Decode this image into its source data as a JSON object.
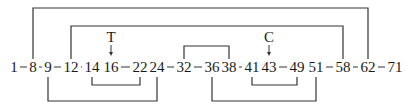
{
  "diagram": {
    "nodes": [
      {
        "label": "1",
        "x": 14
      },
      {
        "label": "8",
        "x": 33
      },
      {
        "label": "9",
        "x": 48
      },
      {
        "label": "12",
        "x": 71
      },
      {
        "label": "14",
        "x": 92
      },
      {
        "label": "16",
        "x": 111
      },
      {
        "label": "22",
        "x": 140
      },
      {
        "label": "24",
        "x": 157
      },
      {
        "label": "32",
        "x": 184
      },
      {
        "label": "36",
        "x": 212
      },
      {
        "label": "38",
        "x": 229
      },
      {
        "label": "41",
        "x": 252
      },
      {
        "label": "43",
        "x": 269
      },
      {
        "label": "49",
        "x": 297
      },
      {
        "label": "51",
        "x": 316
      },
      {
        "label": "58",
        "x": 343
      },
      {
        "label": "62",
        "x": 368
      },
      {
        "label": "71",
        "x": 395
      }
    ],
    "markers": [
      {
        "label": "T",
        "at": "16",
        "x": 111
      },
      {
        "label": "C",
        "at": "43",
        "x": 269
      }
    ],
    "links_above": [
      {
        "from": "8",
        "to": "62",
        "x1": 33,
        "x2": 368,
        "y": 8
      },
      {
        "from": "12",
        "to": "58",
        "x1": 71,
        "x2": 343,
        "y": 26
      },
      {
        "from": "32",
        "to": "38",
        "x1": 184,
        "x2": 229,
        "y": 46
      }
    ],
    "links_below": [
      {
        "from": "14",
        "to": "22",
        "x1": 92,
        "x2": 140,
        "y": 85
      },
      {
        "from": "41",
        "to": "49",
        "x1": 252,
        "x2": 297,
        "y": 85
      },
      {
        "from": "9",
        "to": "24",
        "x1": 48,
        "x2": 157,
        "y": 101
      },
      {
        "from": "36",
        "to": "51",
        "x1": 212,
        "x2": 316,
        "y": 101
      }
    ],
    "colors": {
      "line": "#333333",
      "text": "#1a1a1a"
    }
  }
}
